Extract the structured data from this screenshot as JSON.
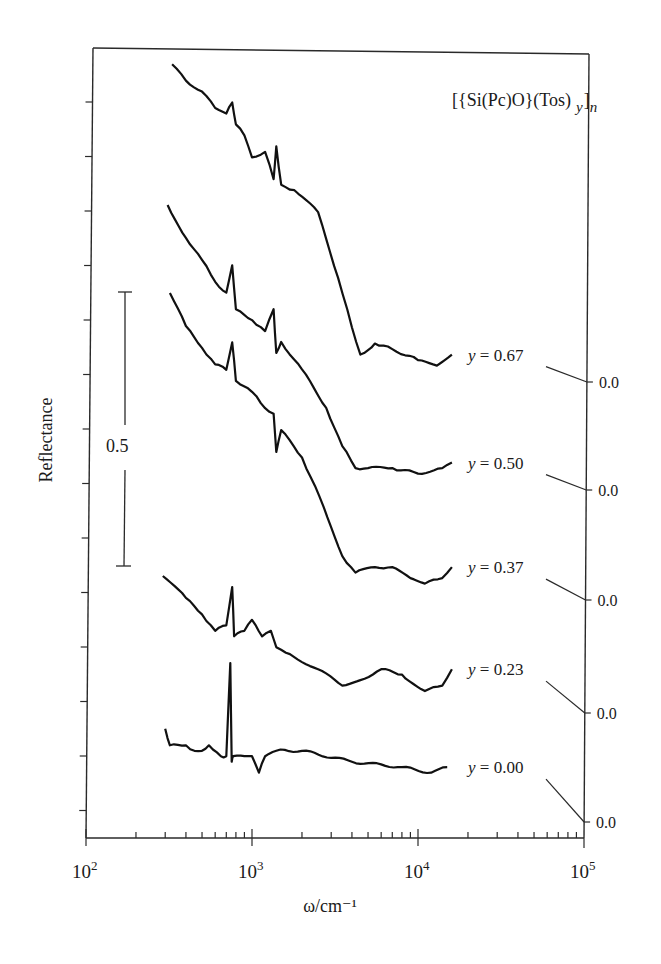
{
  "chart_data": {
    "type": "line",
    "title_parts": {
      "main": "[{Si(Pc)O}(Tos)",
      "sub_y": "y",
      "close": "]",
      "sub_n": "n"
    },
    "xlabel": "ω/cm⁻¹",
    "ylabel": "Reflectance",
    "xscale": "log",
    "xlim": [
      100,
      100000
    ],
    "x_ticks": [
      {
        "value": 100,
        "base": "10",
        "exp": "2"
      },
      {
        "value": 1000,
        "base": "10",
        "exp": "3"
      },
      {
        "value": 10000,
        "base": "10",
        "exp": "4"
      },
      {
        "value": 100000,
        "base": "10",
        "exp": "5"
      }
    ],
    "scale_bar": {
      "label": "0.5",
      "value": 0.5
    },
    "right_axis_label": "0.0",
    "grid": false,
    "legend": "inline labels at right end of each curve, offset baselines marked 0.0 on right axis",
    "series": [
      {
        "name": "y = 0.67",
        "label": "y = 0.67",
        "y_value": "0.67",
        "baseline_px": 382,
        "x": [
          330,
          400,
          500,
          600,
          700,
          760,
          800,
          900,
          1000,
          1200,
          1350,
          1400,
          1500,
          1800,
          2500,
          3300,
          4000,
          4500,
          5500,
          7000,
          10000,
          13000,
          16000
        ],
        "values": [
          0.58,
          0.55,
          0.53,
          0.5,
          0.49,
          0.51,
          0.47,
          0.45,
          0.41,
          0.42,
          0.37,
          0.43,
          0.36,
          0.35,
          0.31,
          0.19,
          0.1,
          0.05,
          0.07,
          0.06,
          0.04,
          0.03,
          0.05
        ]
      },
      {
        "name": "y = 0.50",
        "label": "y = 0.50",
        "y_value": "0.50",
        "baseline_px": 490,
        "x": [
          310,
          400,
          500,
          600,
          700,
          760,
          800,
          1000,
          1200,
          1350,
          1400,
          1500,
          2000,
          2800,
          3500,
          4200,
          5000,
          7000,
          10000,
          14000,
          16000
        ],
        "values": [
          0.52,
          0.46,
          0.42,
          0.38,
          0.36,
          0.41,
          0.33,
          0.31,
          0.29,
          0.33,
          0.25,
          0.27,
          0.22,
          0.15,
          0.08,
          0.04,
          0.04,
          0.04,
          0.03,
          0.04,
          0.05
        ]
      },
      {
        "name": "y = 0.37",
        "label": "y = 0.37",
        "y_value": "0.37",
        "baseline_px": 600,
        "x": [
          320,
          400,
          500,
          600,
          700,
          760,
          800,
          1000,
          1200,
          1350,
          1400,
          1500,
          2000,
          2700,
          3500,
          4200,
          5500,
          7000,
          9000,
          11000,
          14000,
          16000
        ],
        "values": [
          0.56,
          0.5,
          0.46,
          0.43,
          0.42,
          0.47,
          0.4,
          0.38,
          0.35,
          0.34,
          0.27,
          0.31,
          0.26,
          0.17,
          0.08,
          0.05,
          0.06,
          0.06,
          0.04,
          0.03,
          0.04,
          0.06
        ]
      },
      {
        "name": "y = 0.23",
        "label": "y = 0.23",
        "y_value": "0.23",
        "baseline_px": 713,
        "x": [
          290,
          400,
          500,
          600,
          700,
          760,
          780,
          900,
          1000,
          1150,
          1300,
          1400,
          1600,
          2500,
          3500,
          4500,
          6000,
          8000,
          11000,
          14000,
          16000
        ],
        "values": [
          0.25,
          0.21,
          0.18,
          0.15,
          0.16,
          0.23,
          0.14,
          0.15,
          0.17,
          0.14,
          0.15,
          0.12,
          0.11,
          0.08,
          0.05,
          0.06,
          0.08,
          0.07,
          0.04,
          0.05,
          0.08
        ]
      },
      {
        "name": "y = 0.00",
        "label": "y = 0.00",
        "y_value": "0.00",
        "baseline_px": 822,
        "x": [
          300,
          320,
          400,
          450,
          500,
          550,
          650,
          700,
          740,
          755,
          770,
          900,
          1000,
          1100,
          1200,
          1400,
          2000,
          4000,
          8000,
          12000,
          15000
        ],
        "values": [
          0.17,
          0.14,
          0.14,
          0.13,
          0.13,
          0.14,
          0.12,
          0.12,
          0.29,
          0.11,
          0.12,
          0.12,
          0.12,
          0.09,
          0.12,
          0.13,
          0.13,
          0.11,
          0.1,
          0.09,
          0.1
        ]
      }
    ]
  }
}
